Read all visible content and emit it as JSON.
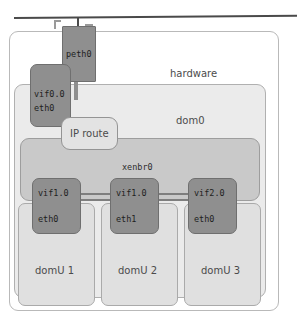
{
  "figure": {
    "caption": ""
  },
  "network": {
    "cable_label": "network-cable"
  },
  "containers": {
    "hardware": {
      "label": "hardware"
    },
    "dom0": {
      "label": "dom0"
    },
    "xenbr0": {
      "label": "xenbr0"
    },
    "domains": [
      {
        "label": "domU 1"
      },
      {
        "label": "domU 2"
      },
      {
        "label": "domU 3"
      }
    ]
  },
  "interfaces": {
    "peth0": {
      "label": "peth0"
    },
    "vif0_0": {
      "primary": "vif0.0",
      "secondary": "eth0"
    },
    "vif1_0_a": {
      "primary": "vif1.0",
      "secondary": "eth0"
    },
    "vif1_0_b": {
      "primary": "vif1.0",
      "secondary": "eth1"
    },
    "vif2_0": {
      "primary": "vif2.0",
      "secondary": "eth0"
    }
  },
  "nodes": {
    "ip_route": {
      "label": "IP route"
    }
  },
  "colors": {
    "interface_fill": "#8f8f8f",
    "dom0_fill": "#ebebeb",
    "xenbr_fill": "#c9c9c9",
    "domu_fill": "#e0e0e0",
    "cable": "#4a4a4a",
    "page_bg": "#ffffff"
  }
}
